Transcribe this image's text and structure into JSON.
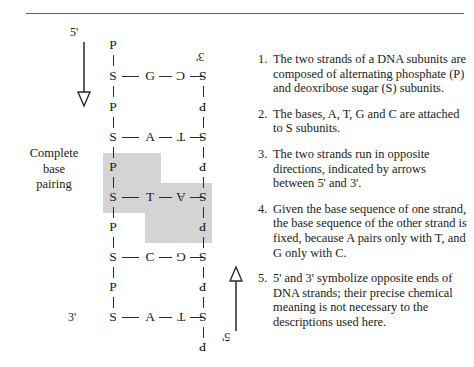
{
  "diagram": {
    "title_caption": "Complete\nbase\npairing",
    "caption_lines": [
      "Complete",
      "base",
      "pairing"
    ],
    "end_labels": {
      "top_left": "5'",
      "top_right": "3'",
      "bottom_left": "3'",
      "bottom_right": "5'"
    },
    "arrows": {
      "left": "down-arrow",
      "right": "up-arrow"
    },
    "backbone_left_label": "S",
    "backbone_right_label": "S",
    "phosphate_left_label": "P",
    "phosphate_right_label": "P",
    "rows": [
      {
        "type": "phosphate",
        "left": "P",
        "right": "P",
        "right_flipped": true,
        "left_only": true
      },
      {
        "type": "rung",
        "left_sugar": "S",
        "left_base": "G",
        "right_base": "C",
        "right_sugar": "S"
      },
      {
        "type": "phosphate",
        "left": "P",
        "right": "P"
      },
      {
        "type": "rung",
        "left_sugar": "S",
        "left_base": "A",
        "right_base": "T",
        "right_sugar": "S"
      },
      {
        "type": "phosphate",
        "left": "P",
        "right": "P"
      },
      {
        "type": "rung",
        "left_sugar": "S",
        "left_base": "T",
        "right_base": "A",
        "right_sugar": "S"
      },
      {
        "type": "phosphate",
        "left": "P",
        "right": "P"
      },
      {
        "type": "rung",
        "left_sugar": "S",
        "left_base": "C",
        "right_base": "G",
        "right_sugar": "S"
      },
      {
        "type": "phosphate",
        "left": "P",
        "right": "P"
      },
      {
        "type": "rung",
        "left_sugar": "S",
        "left_base": "A",
        "right_base": "T",
        "right_sugar": "S"
      },
      {
        "type": "phosphate",
        "left": "",
        "right": "P",
        "right_only": true
      }
    ],
    "highlight_color": "#d4d4d4"
  },
  "notes": [
    {
      "number": "1.",
      "text": "The two strands of a DNA subunits are composed of alternating phosphate (P) and deoxribose sugar (S) subunits."
    },
    {
      "number": "2.",
      "text": "The bases, A, T, G and C are attached to S subunits."
    },
    {
      "number": "3.",
      "text": "The two strands run in opposite directions, indicated by arrows between 5' and 3'."
    },
    {
      "number": "4.",
      "text": "Given the base sequence of one strand, the base sequence of the  other strand is fixed, because A pairs only with T, and G only with C."
    },
    {
      "number": "5.",
      "text": "5' and 3' symbolize opposite ends of DNA strands; their precise chemical meaning is not necessary to the descriptions used here."
    }
  ]
}
